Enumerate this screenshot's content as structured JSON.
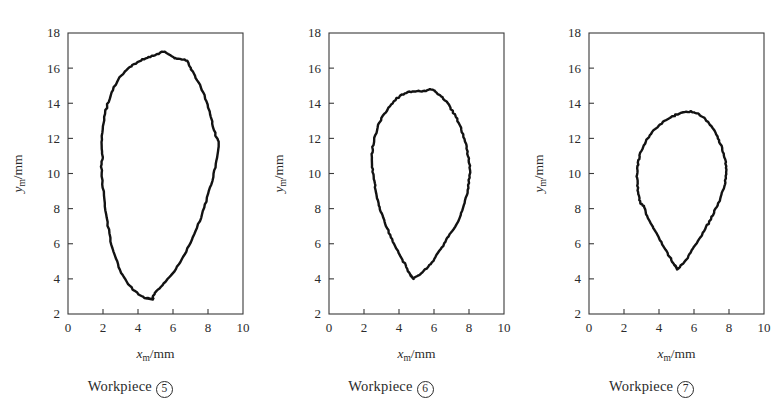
{
  "figure": {
    "background_color": "#ffffff",
    "line_color": "#121212",
    "axis_color": "#3a3a3a"
  },
  "panels": [
    {
      "id": "panel-workpiece-5",
      "caption_prefix": "Workpiece",
      "caption_number": "5",
      "xlabel_var": "x",
      "xlabel_sub": "m",
      "xlabel_unit": "/mm",
      "ylabel_var": "y",
      "ylabel_sub": "m",
      "ylabel_unit": "/mm"
    },
    {
      "id": "panel-workpiece-6",
      "caption_prefix": "Workpiece",
      "caption_number": "6",
      "xlabel_var": "x",
      "xlabel_sub": "m",
      "xlabel_unit": "/mm",
      "ylabel_var": "y",
      "ylabel_sub": "m",
      "ylabel_unit": "/mm"
    },
    {
      "id": "panel-workpiece-7",
      "caption_prefix": "Workpiece",
      "caption_number": "7",
      "xlabel_var": "x",
      "xlabel_sub": "m",
      "xlabel_unit": "/mm",
      "ylabel_var": "y",
      "ylabel_sub": "m",
      "ylabel_unit": "/mm"
    }
  ],
  "chart_data": [
    {
      "type": "line",
      "title": "Workpiece 5",
      "xlabel": "x_m/mm",
      "ylabel": "y_m/mm",
      "xlim": [
        0,
        10
      ],
      "ylim": [
        2,
        18
      ],
      "xticks": [
        0,
        2,
        4,
        6,
        8,
        10
      ],
      "yticks": [
        2,
        4,
        6,
        8,
        10,
        12,
        14,
        16,
        18
      ],
      "grid": false,
      "legend": "none",
      "closed": true,
      "series": [
        {
          "name": "workpiece-5-cross-section",
          "points": [
            [
              4.85,
              2.82
            ],
            [
              4.4,
              2.93
            ],
            [
              4.05,
              3.12
            ],
            [
              3.7,
              3.4
            ],
            [
              3.42,
              3.72
            ],
            [
              3.18,
              4.08
            ],
            [
              2.98,
              4.5
            ],
            [
              2.78,
              5.0
            ],
            [
              2.6,
              5.55
            ],
            [
              2.45,
              6.15
            ],
            [
              2.32,
              6.8
            ],
            [
              2.22,
              7.45
            ],
            [
              2.12,
              8.1
            ],
            [
              2.04,
              8.75
            ],
            [
              1.98,
              9.4
            ],
            [
              1.92,
              10.05
            ],
            [
              1.9,
              10.55
            ],
            [
              1.97,
              10.95
            ],
            [
              1.92,
              11.4
            ],
            [
              1.94,
              11.95
            ],
            [
              1.98,
              12.5
            ],
            [
              2.05,
              13.05
            ],
            [
              2.16,
              13.6
            ],
            [
              2.3,
              14.1
            ],
            [
              2.48,
              14.6
            ],
            [
              2.7,
              15.05
            ],
            [
              2.95,
              15.45
            ],
            [
              3.22,
              15.8
            ],
            [
              3.52,
              16.08
            ],
            [
              3.78,
              16.22
            ],
            [
              4.05,
              16.38
            ],
            [
              4.35,
              16.52
            ],
            [
              4.62,
              16.62
            ],
            [
              4.9,
              16.72
            ],
            [
              5.18,
              16.82
            ],
            [
              5.45,
              16.95
            ],
            [
              5.62,
              16.88
            ],
            [
              5.85,
              16.72
            ],
            [
              6.08,
              16.58
            ],
            [
              6.32,
              16.52
            ],
            [
              6.58,
              16.5
            ],
            [
              6.82,
              16.4
            ],
            [
              6.95,
              16.1
            ],
            [
              7.1,
              15.8
            ],
            [
              7.3,
              15.45
            ],
            [
              7.52,
              15.05
            ],
            [
              7.72,
              14.6
            ],
            [
              7.92,
              14.1
            ],
            [
              8.08,
              13.55
            ],
            [
              8.22,
              13.0
            ],
            [
              8.35,
              12.48
            ],
            [
              8.48,
              12.05
            ],
            [
              8.62,
              11.85
            ],
            [
              8.58,
              11.4
            ],
            [
              8.5,
              10.9
            ],
            [
              8.4,
              10.35
            ],
            [
              8.28,
              9.78
            ],
            [
              8.12,
              9.2
            ],
            [
              7.95,
              8.62
            ],
            [
              7.78,
              8.05
            ],
            [
              7.58,
              7.48
            ],
            [
              7.38,
              6.92
            ],
            [
              7.15,
              6.38
            ],
            [
              6.92,
              5.88
            ],
            [
              6.68,
              5.4
            ],
            [
              6.42,
              4.95
            ],
            [
              6.15,
              4.55
            ],
            [
              5.88,
              4.18
            ],
            [
              5.58,
              3.85
            ],
            [
              5.28,
              3.55
            ],
            [
              5.05,
              3.3
            ],
            [
              4.85,
              3.02
            ]
          ]
        }
      ]
    },
    {
      "type": "line",
      "title": "Workpiece 6",
      "xlabel": "x_m/mm",
      "ylabel": "y_m/mm",
      "xlim": [
        0,
        10
      ],
      "ylim": [
        2,
        18
      ],
      "xticks": [
        0,
        2,
        4,
        6,
        8,
        10
      ],
      "yticks": [
        2,
        4,
        6,
        8,
        10,
        12,
        14,
        16,
        18
      ],
      "grid": false,
      "legend": "none",
      "closed": true,
      "series": [
        {
          "name": "workpiece-6-cross-section",
          "points": [
            [
              4.8,
              4.02
            ],
            [
              4.62,
              4.25
            ],
            [
              4.48,
              4.55
            ],
            [
              4.32,
              4.88
            ],
            [
              4.12,
              5.25
            ],
            [
              3.92,
              5.62
            ],
            [
              3.72,
              6.0
            ],
            [
              3.55,
              6.38
            ],
            [
              3.38,
              6.75
            ],
            [
              3.22,
              7.12
            ],
            [
              3.08,
              7.48
            ],
            [
              2.95,
              7.85
            ],
            [
              2.85,
              8.2
            ],
            [
              2.75,
              8.58
            ],
            [
              2.68,
              8.95
            ],
            [
              2.62,
              9.32
            ],
            [
              2.56,
              9.7
            ],
            [
              2.5,
              10.1
            ],
            [
              2.46,
              10.5
            ],
            [
              2.42,
              10.95
            ],
            [
              2.48,
              11.35
            ],
            [
              2.55,
              11.78
            ],
            [
              2.65,
              12.2
            ],
            [
              2.78,
              12.62
            ],
            [
              2.95,
              13.0
            ],
            [
              3.15,
              13.38
            ],
            [
              3.38,
              13.72
            ],
            [
              3.62,
              14.02
            ],
            [
              3.88,
              14.28
            ],
            [
              4.15,
              14.48
            ],
            [
              4.42,
              14.6
            ],
            [
              4.68,
              14.66
            ],
            [
              4.95,
              14.68
            ],
            [
              5.22,
              14.68
            ],
            [
              5.48,
              14.7
            ],
            [
              5.7,
              14.76
            ],
            [
              5.92,
              14.8
            ],
            [
              6.1,
              14.68
            ],
            [
              6.32,
              14.48
            ],
            [
              6.55,
              14.25
            ],
            [
              6.78,
              13.98
            ],
            [
              6.98,
              13.68
            ],
            [
              7.18,
              13.35
            ],
            [
              7.36,
              13.0
            ],
            [
              7.52,
              12.62
            ],
            [
              7.66,
              12.22
            ],
            [
              7.78,
              11.82
            ],
            [
              7.88,
              11.4
            ],
            [
              7.95,
              11.0
            ],
            [
              8.02,
              10.6
            ],
            [
              8.05,
              10.18
            ],
            [
              8.02,
              9.75
            ],
            [
              7.98,
              9.32
            ],
            [
              7.9,
              8.9
            ],
            [
              7.8,
              8.48
            ],
            [
              7.68,
              8.05
            ],
            [
              7.52,
              7.62
            ],
            [
              7.35,
              7.2
            ],
            [
              7.12,
              6.85
            ],
            [
              6.92,
              6.55
            ],
            [
              6.72,
              6.22
            ],
            [
              6.52,
              5.9
            ],
            [
              6.32,
              5.58
            ],
            [
              6.1,
              5.25
            ],
            [
              5.88,
              4.95
            ],
            [
              5.65,
              4.68
            ],
            [
              5.42,
              4.45
            ],
            [
              5.18,
              4.25
            ],
            [
              4.98,
              4.1
            ],
            [
              4.82,
              4.02
            ]
          ]
        }
      ]
    },
    {
      "type": "line",
      "title": "Workpiece 7",
      "xlabel": "x_m/mm",
      "ylabel": "y_m/mm",
      "xlim": [
        0,
        10
      ],
      "ylim": [
        2,
        18
      ],
      "xticks": [
        0,
        2,
        4,
        6,
        8,
        10
      ],
      "yticks": [
        2,
        4,
        6,
        8,
        10,
        12,
        14,
        16,
        18
      ],
      "grid": false,
      "legend": "none",
      "closed": true,
      "series": [
        {
          "name": "workpiece-7-cross-section",
          "points": [
            [
              5.05,
              4.55
            ],
            [
              4.88,
              4.8
            ],
            [
              4.72,
              5.08
            ],
            [
              4.55,
              5.38
            ],
            [
              4.38,
              5.68
            ],
            [
              4.2,
              5.98
            ],
            [
              4.02,
              6.28
            ],
            [
              3.85,
              6.58
            ],
            [
              3.68,
              6.88
            ],
            [
              3.52,
              7.18
            ],
            [
              3.38,
              7.48
            ],
            [
              3.25,
              7.78
            ],
            [
              3.15,
              8.05
            ],
            [
              3.05,
              8.25
            ],
            [
              2.95,
              8.3
            ],
            [
              2.88,
              8.62
            ],
            [
              2.82,
              8.95
            ],
            [
              2.78,
              9.28
            ],
            [
              2.75,
              9.62
            ],
            [
              2.74,
              9.95
            ],
            [
              2.76,
              10.28
            ],
            [
              2.8,
              10.62
            ],
            [
              2.88,
              10.95
            ],
            [
              2.98,
              11.28
            ],
            [
              3.12,
              11.6
            ],
            [
              3.28,
              11.9
            ],
            [
              3.48,
              12.18
            ],
            [
              3.7,
              12.45
            ],
            [
              3.95,
              12.7
            ],
            [
              4.22,
              12.92
            ],
            [
              4.5,
              13.1
            ],
            [
              4.78,
              13.25
            ],
            [
              5.05,
              13.38
            ],
            [
              5.32,
              13.46
            ],
            [
              5.58,
              13.5
            ],
            [
              5.82,
              13.52
            ],
            [
              6.05,
              13.48
            ],
            [
              6.28,
              13.38
            ],
            [
              6.5,
              13.22
            ],
            [
              6.72,
              13.02
            ],
            [
              6.92,
              12.78
            ],
            [
              7.1,
              12.52
            ],
            [
              7.28,
              12.22
            ],
            [
              7.42,
              11.9
            ],
            [
              7.55,
              11.58
            ],
            [
              7.66,
              11.25
            ],
            [
              7.75,
              10.9
            ],
            [
              7.82,
              10.55
            ],
            [
              7.86,
              10.2
            ],
            [
              7.84,
              9.85
            ],
            [
              7.78,
              9.5
            ],
            [
              7.7,
              9.15
            ],
            [
              7.58,
              8.8
            ],
            [
              7.45,
              8.45
            ],
            [
              7.3,
              8.1
            ],
            [
              7.12,
              7.75
            ],
            [
              6.95,
              7.4
            ],
            [
              6.76,
              7.05
            ],
            [
              6.56,
              6.72
            ],
            [
              6.36,
              6.38
            ],
            [
              6.15,
              6.05
            ],
            [
              5.95,
              5.72
            ],
            [
              5.75,
              5.42
            ],
            [
              5.55,
              5.12
            ],
            [
              5.38,
              4.88
            ],
            [
              5.2,
              4.68
            ],
            [
              5.08,
              4.56
            ]
          ]
        }
      ]
    }
  ]
}
